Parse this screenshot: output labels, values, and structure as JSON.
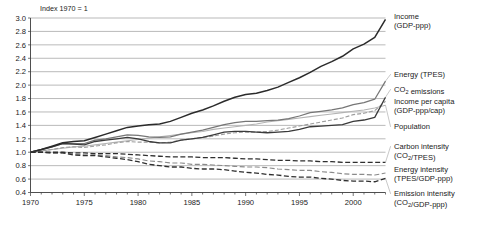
{
  "chart_data": {
    "type": "line",
    "title": "Index 1970 = 1",
    "xlabel": "",
    "ylabel": "",
    "xlim": [
      1970,
      2003
    ],
    "ylim": [
      0.4,
      3.0
    ],
    "ytick_step": 0.2,
    "grid": true,
    "legend_position": "right-outside",
    "xticks": [
      1970,
      1975,
      1980,
      1985,
      1990,
      1995,
      2000
    ],
    "xtick_labels": [
      "1970",
      "1975",
      "1980",
      "1985",
      "1990",
      "1995",
      "2000"
    ],
    "x_minor_tick_step": 1,
    "yticks": [
      0.4,
      0.6,
      0.8,
      1.0,
      1.2,
      1.4,
      1.6,
      1.8,
      2.0,
      2.2,
      2.4,
      2.6,
      2.8,
      3.0
    ],
    "ytick_labels": [
      "0.4",
      "0.6",
      "0.8",
      "1.0",
      "1.2",
      "1.4",
      "1.6",
      "1.8",
      "2.0",
      "2.2",
      "2.4",
      "2.6",
      "2.8",
      "3.0"
    ],
    "x": [
      1970,
      1971,
      1972,
      1973,
      1974,
      1975,
      1976,
      1977,
      1978,
      1979,
      1980,
      1981,
      1982,
      1983,
      1984,
      1985,
      1986,
      1987,
      1988,
      1989,
      1990,
      1991,
      1992,
      1993,
      1994,
      1995,
      1996,
      1997,
      1998,
      1999,
      2000,
      2001,
      2002,
      2003
    ],
    "series": [
      {
        "name": "Income (GDP-ppp)",
        "label_line1": "Income",
        "label_line2": "(GDP-ppp)",
        "style": "solid",
        "color": "#2b2b2b",
        "width": 1.5,
        "values": [
          1.0,
          1.04,
          1.09,
          1.14,
          1.16,
          1.17,
          1.22,
          1.27,
          1.32,
          1.37,
          1.39,
          1.41,
          1.42,
          1.46,
          1.52,
          1.58,
          1.63,
          1.69,
          1.76,
          1.82,
          1.86,
          1.88,
          1.92,
          1.97,
          2.04,
          2.11,
          2.19,
          2.28,
          2.35,
          2.43,
          2.54,
          2.61,
          2.71,
          2.98
        ]
      },
      {
        "name": "Energy (TPES)",
        "label_line1": "Energy (TPES)",
        "label_line2": "",
        "style": "solid",
        "color": "#767676",
        "width": 1.25,
        "values": [
          1.0,
          1.04,
          1.08,
          1.13,
          1.13,
          1.13,
          1.18,
          1.2,
          1.23,
          1.26,
          1.25,
          1.23,
          1.22,
          1.23,
          1.27,
          1.3,
          1.33,
          1.37,
          1.41,
          1.44,
          1.46,
          1.46,
          1.47,
          1.48,
          1.5,
          1.54,
          1.59,
          1.61,
          1.63,
          1.66,
          1.71,
          1.74,
          1.79,
          2.06
        ]
      },
      {
        "name": "CO2 emissions",
        "label_line1": "CO",
        "label_line1_sub": "2",
        "label_line1_tail": " emissions",
        "label_line2": "",
        "style": "solid",
        "color": "#3a3a3a",
        "width": 1.3,
        "values": [
          1.0,
          1.04,
          1.08,
          1.13,
          1.12,
          1.11,
          1.16,
          1.18,
          1.2,
          1.22,
          1.2,
          1.16,
          1.14,
          1.14,
          1.18,
          1.2,
          1.22,
          1.26,
          1.3,
          1.31,
          1.31,
          1.3,
          1.29,
          1.3,
          1.31,
          1.34,
          1.38,
          1.39,
          1.4,
          1.41,
          1.46,
          1.48,
          1.52,
          1.82
        ]
      },
      {
        "name": "Income per capita (GDP-ppp/cap)",
        "label_line1": "Income per capita",
        "label_line2": "(GDP-ppp/cap)",
        "style": "dashed-light",
        "color": "#9d9d9d",
        "width": 1.1,
        "dash": "4,2",
        "values": [
          1.0,
          1.02,
          1.04,
          1.07,
          1.08,
          1.07,
          1.09,
          1.11,
          1.14,
          1.16,
          1.15,
          1.15,
          1.14,
          1.15,
          1.18,
          1.2,
          1.22,
          1.24,
          1.27,
          1.29,
          1.3,
          1.3,
          1.31,
          1.33,
          1.36,
          1.39,
          1.42,
          1.45,
          1.48,
          1.51,
          1.56,
          1.58,
          1.62,
          1.76
        ]
      },
      {
        "name": "Population",
        "label_line1": "Population",
        "label_line2": "",
        "style": "solid-light",
        "color": "#b3b3b3",
        "width": 1.1,
        "values": [
          1.0,
          1.02,
          1.04,
          1.06,
          1.08,
          1.09,
          1.11,
          1.13,
          1.15,
          1.17,
          1.19,
          1.21,
          1.23,
          1.25,
          1.27,
          1.29,
          1.31,
          1.34,
          1.36,
          1.38,
          1.4,
          1.42,
          1.45,
          1.47,
          1.49,
          1.51,
          1.53,
          1.55,
          1.57,
          1.59,
          1.61,
          1.63,
          1.66,
          1.7
        ]
      },
      {
        "name": "Carbon intensity (CO2/TPES)",
        "label_line1": "Carbon intensity",
        "label_line2": "(CO",
        "label_line2_sub": "2",
        "label_line2_tail": "/TPES)",
        "style": "dashed",
        "color": "#2f2f2f",
        "width": 1.3,
        "dash": "5,2.5",
        "values": [
          1.0,
          1.0,
          1.0,
          1.0,
          0.99,
          0.99,
          0.98,
          0.98,
          0.98,
          0.97,
          0.96,
          0.95,
          0.94,
          0.93,
          0.93,
          0.93,
          0.92,
          0.92,
          0.92,
          0.91,
          0.9,
          0.9,
          0.89,
          0.88,
          0.88,
          0.87,
          0.87,
          0.86,
          0.86,
          0.85,
          0.85,
          0.85,
          0.85,
          0.85
        ]
      },
      {
        "name": "Energy intensity (TPES/GDP-ppp)",
        "label_line1": "Energy intensity",
        "label_line2": "(TPES/GDP-ppp)",
        "style": "dashed-mid",
        "color": "#8a8a8a",
        "width": 1.15,
        "dash": "5,2.5",
        "values": [
          1.0,
          1.0,
          0.99,
          0.99,
          0.97,
          0.96,
          0.96,
          0.95,
          0.93,
          0.92,
          0.9,
          0.87,
          0.86,
          0.84,
          0.84,
          0.82,
          0.82,
          0.81,
          0.8,
          0.79,
          0.78,
          0.78,
          0.77,
          0.75,
          0.74,
          0.73,
          0.73,
          0.71,
          0.7,
          0.68,
          0.67,
          0.67,
          0.66,
          0.69
        ]
      },
      {
        "name": "Emission intensity (CO2/GDP-ppp)",
        "label_line1": "Emission intensity",
        "label_line2": "(CO",
        "label_line2_sub": "2",
        "label_line2_tail": "/GDP-ppp)",
        "style": "dashed",
        "color": "#2f2f2f",
        "width": 1.3,
        "dash": "5,2.5",
        "values": [
          1.0,
          1.0,
          0.99,
          0.99,
          0.96,
          0.95,
          0.95,
          0.93,
          0.91,
          0.89,
          0.86,
          0.82,
          0.8,
          0.78,
          0.78,
          0.76,
          0.75,
          0.75,
          0.74,
          0.72,
          0.7,
          0.69,
          0.67,
          0.66,
          0.64,
          0.63,
          0.63,
          0.61,
          0.6,
          0.58,
          0.57,
          0.57,
          0.56,
          0.61
        ]
      }
    ]
  },
  "legend": {
    "entries": [
      {
        "line1": "Income",
        "line2": "(GDP-ppp)"
      },
      {
        "line1": "Energy (TPES)",
        "line2": ""
      },
      {
        "line1": "CO₂ emissions",
        "line2": ""
      },
      {
        "line1": "Income per capita",
        "line2": "(GDP-ppp/cap)"
      },
      {
        "line1": "Population",
        "line2": ""
      },
      {
        "line1": "Carbon intensity",
        "line2": "(CO₂/TPES)"
      },
      {
        "line1": "Energy intensity",
        "line2": "(TPES/GDP-ppp)"
      },
      {
        "line1": "Emission intensity",
        "line2": "(CO₂/GDP-ppp)"
      }
    ]
  }
}
